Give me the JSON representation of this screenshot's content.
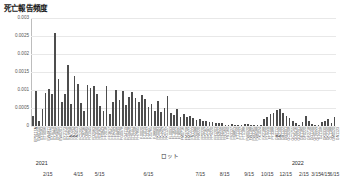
{
  "chart_data": {
    "type": "bar",
    "title": "死亡報告頻度",
    "xlabel": "ロット",
    "ylabel": "",
    "ylim": [
      0,
      0.003
    ],
    "grid": true,
    "legend": null,
    "yticks": [
      "0.003",
      "0.0025",
      "0.002",
      "0.0015",
      "0.001",
      "0.0005",
      "0"
    ],
    "ytick_values": [
      0.003,
      0.0025,
      0.002,
      0.0015,
      0.001,
      0.0005,
      0
    ],
    "bar_color": "#4d4d4d",
    "grid_color": "#e8e8e8",
    "categories": [
      "EP9117A",
      "EW0150",
      "EY0583",
      "ET9096",
      "EW4811",
      "EY0779",
      "EY3860",
      "EP9605",
      "EW0201",
      "EY2173",
      "EY5420",
      "FA7298",
      "FA1234",
      "FA2453",
      "FC5295",
      "FC8736",
      "FD0889",
      "FD1945",
      "FD2963",
      "FE3590",
      "FE8162",
      "FF0843",
      "FF2018",
      "FF3617",
      "FF4204",
      "FF5104",
      "FF8839",
      "FG0978",
      "FG4119",
      "FG9428",
      "FH0151",
      "FH2208",
      "FH7895",
      "FJ0020",
      "FJ1019",
      "FJ3127",
      "FJ5765",
      "FJ8890",
      "FK0083",
      "FK1284",
      "FK2797",
      "FK5127",
      "FL0093",
      "FL1839",
      "FL3052",
      "FL8095",
      "FM0716",
      "FM3708",
      "FM7277",
      "FN1123",
      "FN5988",
      "FN8220",
      "FP0220",
      "FP2167",
      "FP5187",
      "FP9220",
      "FR1203",
      "FR2622",
      "FR3590",
      "FR7569",
      "FS1160",
      "FS3127",
      "FS8853",
      "FT1190",
      "FT3127",
      "FT5188",
      "FW0920",
      "FW1188",
      "FW3165",
      "FW6588",
      "FX1024",
      "FX2188",
      "FY0220",
      "FY1150",
      "FY3388",
      "GA0112",
      "GA2190",
      "GB1122",
      "GB3391",
      "GC0208",
      "GC1755",
      "GD0416",
      "GD2291",
      "GE1180",
      "GF0220",
      "GF2718",
      "GG1190",
      "GH0520",
      "GH2277",
      "GJ1108",
      "GK0330",
      "GK2190",
      "GL1188",
      "GM0520",
      "GN1123"
    ],
    "values": [
      0.00027,
      0.00098,
      0.00014,
      0.00048,
      0.00091,
      0.00102,
      0.00088,
      0.00259,
      0.0013,
      0.00066,
      0.00089,
      0.0017,
      0.00061,
      0.0014,
      0.00117,
      0.00063,
      0.00042,
      0.00113,
      0.00106,
      0.00112,
      0.00088,
      0.00055,
      0.00043,
      0.0011,
      0.00033,
      0.00068,
      0.00101,
      0.00072,
      0.00097,
      0.00058,
      0.00081,
      0.00094,
      0.00079,
      0.00066,
      0.00086,
      0.00075,
      0.00052,
      0.00061,
      0.00043,
      0.0007,
      0.00038,
      0.0005,
      0.00083,
      0.00036,
      0.0003,
      0.00047,
      0.00026,
      0.00034,
      0.00024,
      0.00029,
      0.00022,
      0.00017,
      0.0002,
      0.00015,
      0.00013,
      0.0001,
      0.00012,
      8e-05,
      7e-05,
      9e-05,
      4e-05,
      3e-05,
      5e-05,
      4e-05,
      3e-05,
      2e-05,
      6e-05,
      5e-05,
      4e-05,
      3e-05,
      2e-05,
      3e-05,
      0.00019,
      0.00026,
      0.00032,
      0.00037,
      0.00044,
      0.00048,
      0.00035,
      0.00027,
      0.00021,
      0.00013,
      9e-05,
      4e-05,
      0.00011,
      0.00028,
      0.00015,
      5e-05,
      3e-05,
      2e-05,
      0.0001,
      0.00014,
      0.0002,
      9e-05,
      0.00026
    ],
    "date_ticks": [
      {
        "label": "2/15",
        "pos": 0.055
      },
      {
        "label": "4/15",
        "pos": 0.155
      },
      {
        "label": "5/15",
        "pos": 0.225
      },
      {
        "label": "6/15",
        "pos": 0.385
      },
      {
        "label": "7/15",
        "pos": 0.555
      },
      {
        "label": "8/15",
        "pos": 0.635
      },
      {
        "label": "9/15",
        "pos": 0.715
      },
      {
        "label": "10/15",
        "pos": 0.775
      },
      {
        "label": "12/15",
        "pos": 0.835
      },
      {
        "label": "2/15",
        "pos": 0.895
      },
      {
        "label": "3/15",
        "pos": 0.935
      },
      {
        "label": "4/15",
        "pos": 0.965
      },
      {
        "label": "6/15",
        "pos": 0.995
      }
    ],
    "year_ticks": [
      {
        "label": "2021",
        "pos": 0.035
      },
      {
        "label": "2022",
        "pos": 0.875
      }
    ]
  }
}
